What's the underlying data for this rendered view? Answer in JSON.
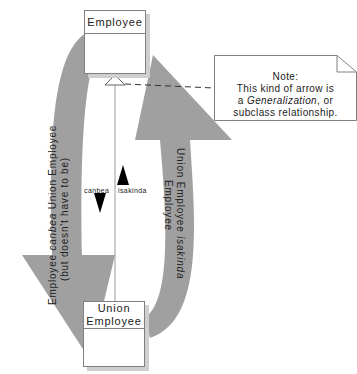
{
  "classes": {
    "employee": {
      "name": "Employee"
    },
    "union_employee": {
      "name_line1": "Union",
      "name_line2": "Employee"
    }
  },
  "note": {
    "title": "Note:",
    "line1": "This kind of arrow is",
    "line2_prefix": "a ",
    "line2_italic": "Generalization",
    "line2_suffix": ", or",
    "line3": "subclass relationship."
  },
  "left_arrow": {
    "line1_a": "Employee ",
    "line1_italic": "canbea",
    "line1_b": " Union Employee",
    "line2": "(but doesn't have to be)"
  },
  "right_arrow": {
    "line1_a": "Union Employee ",
    "line1_italic": "isakinda",
    "line2": "Employee"
  },
  "center_labels": {
    "canbea": "canbea",
    "isakinda": "isakinda"
  },
  "colors": {
    "arrow_fill": "#a0a0a0",
    "box_border": "#808080",
    "shadow": "#cfcfcf"
  }
}
